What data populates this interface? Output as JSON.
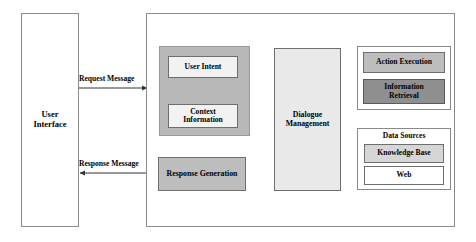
{
  "diagram": {
    "colors": {
      "frame_border": "#8a8a8a",
      "nlu_group_fill": "#b8b8b8",
      "dialogue_fill": "#e9e9e9",
      "response_fill": "#bdbdbd",
      "action_fill": "#bdbdbd",
      "retrieval_fill": "#8f8f8f",
      "knowledge_fill": "#d6d6d6",
      "web_fill": "#ffffff",
      "inner_box_fill": "#f2f2f2",
      "line": "#333333"
    },
    "nodes": {
      "user_interface": "User\nInterface",
      "user_interface_line1": "User",
      "user_interface_line2": "Interface",
      "user_intent": "User Intent",
      "context_information_line1": "Context",
      "context_information_line2": "Information",
      "dialogue_management_line1": "Dialogue",
      "dialogue_management_line2": "Management",
      "response_generation": "Response Generation",
      "action_execution": "Action Execution",
      "information_retrieval_line1": "Information",
      "information_retrieval_line2": "Retrieval",
      "data_sources": "Data Sources",
      "knowledge_base": "Knowledge Base",
      "web": "Web"
    },
    "edges": {
      "request_message": "Request Message",
      "response_message": "Response Message"
    }
  }
}
